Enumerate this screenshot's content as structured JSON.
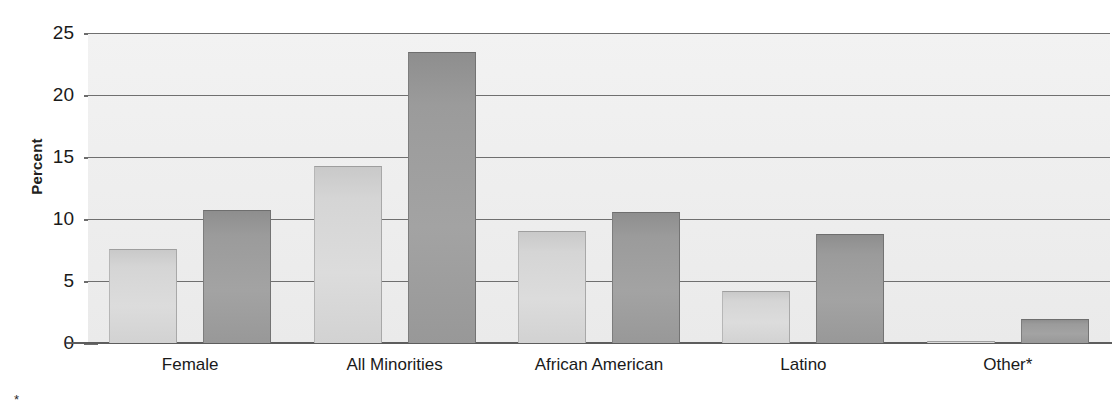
{
  "chart_data": {
    "type": "bar",
    "title": "",
    "xlabel": "",
    "ylabel": "Percent",
    "ylim": [
      0,
      25
    ],
    "yticks": [
      0,
      5,
      10,
      15,
      20,
      25
    ],
    "ytick_labels": [
      "0",
      "5",
      "10",
      "15",
      "20",
      "25"
    ],
    "grid": true,
    "legend": "none",
    "categories": [
      "Female",
      "All Minorities",
      "African American",
      "Latino",
      "Other*"
    ],
    "series": [
      {
        "name": "light-series",
        "color": "#d5d5d5",
        "values": [
          7.6,
          14.3,
          9.0,
          4.2,
          0.2
        ]
      },
      {
        "name": "dark-series",
        "color": "#9a9a9a",
        "values": [
          10.7,
          23.5,
          10.6,
          8.8,
          1.9
        ]
      }
    ],
    "footnote": "*"
  },
  "axis": {
    "y_title": "Percent"
  },
  "colors": {
    "plot_background": "#efefef",
    "gridline": "#6f6f6f",
    "axis_line": "#5d5d5d",
    "light_bar": "#d5d5d5",
    "dark_bar": "#9a9a9a",
    "text": "#1a1a1a"
  }
}
